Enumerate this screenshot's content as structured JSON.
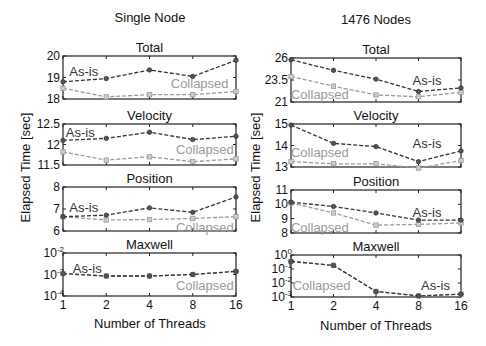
{
  "figure": {
    "left_title": "Single Node",
    "right_title": "1476 Nodes",
    "ylabel": "Elapsed Time [sec]",
    "xlabel": "Number of Threads",
    "colors": {
      "as_is": "#333333",
      "collapsed": "#9a9a9a",
      "frame": "#222222"
    }
  },
  "chart_data": [
    {
      "type": "line",
      "column": "Single Node",
      "title": "Total",
      "x": [
        1,
        2,
        4,
        8,
        16
      ],
      "xscale": "log2",
      "ylim": [
        18,
        20
      ],
      "yticks": [
        "18",
        "19",
        "20"
      ],
      "yscale": "linear",
      "series": [
        {
          "name": "As-is",
          "values": [
            18.8,
            18.95,
            19.35,
            19.05,
            19.8
          ]
        },
        {
          "name": "Collapsed",
          "values": [
            18.5,
            18.1,
            18.2,
            18.2,
            18.35
          ]
        }
      ],
      "labels": [
        {
          "text": "As-is",
          "pos": [
            0.12,
            0.35
          ]
        },
        {
          "text": "Collapsed",
          "pos": [
            0.79,
            0.63
          ]
        }
      ]
    },
    {
      "type": "line",
      "column": "Single Node",
      "title": "Velocity",
      "x": [
        1,
        2,
        4,
        8,
        16
      ],
      "xscale": "log2",
      "ylim": [
        11.5,
        12.5
      ],
      "yticks": [
        "11.5",
        "12",
        "12.5"
      ],
      "yscale": "linear",
      "series": [
        {
          "name": "As-is",
          "values": [
            12.1,
            12.15,
            12.3,
            12.12,
            12.2
          ]
        },
        {
          "name": "Collapsed",
          "values": [
            11.82,
            11.62,
            11.7,
            11.58,
            11.65
          ]
        }
      ],
      "labels": [
        {
          "text": "As-is",
          "pos": [
            0.1,
            0.2
          ]
        },
        {
          "text": "Collapsed",
          "pos": [
            0.82,
            0.6
          ]
        }
      ]
    },
    {
      "type": "line",
      "column": "Single Node",
      "title": "Position",
      "x": [
        1,
        2,
        4,
        8,
        16
      ],
      "xscale": "log2",
      "ylim": [
        6,
        8
      ],
      "yticks": [
        "6",
        "7",
        "8"
      ],
      "yscale": "linear",
      "series": [
        {
          "name": "As-is",
          "values": [
            6.65,
            6.72,
            7.05,
            6.85,
            7.55
          ]
        },
        {
          "name": "Collapsed",
          "values": [
            6.65,
            6.5,
            6.52,
            6.57,
            6.65
          ]
        }
      ],
      "labels": [
        {
          "text": "As-is",
          "pos": [
            0.12,
            0.45
          ]
        },
        {
          "text": "Collapsed",
          "pos": [
            0.82,
            0.92
          ]
        }
      ]
    },
    {
      "type": "line",
      "column": "Single Node",
      "title": "Maxwell",
      "x": [
        1,
        2,
        4,
        8,
        16
      ],
      "xscale": "log2",
      "ylim": [
        0.0001,
        0.01
      ],
      "yticks": [
        "10^-4",
        "10^-3",
        "10^-2"
      ],
      "yscale": "log",
      "series": [
        {
          "name": "As-is",
          "values": [
            0.0011,
            0.00085,
            0.00085,
            0.001,
            0.0014
          ]
        },
        {
          "name": "Collapsed",
          "values": [
            0.0011,
            0.00085,
            0.00085,
            0.001,
            0.0014
          ]
        }
      ],
      "labels": [
        {
          "text": "As-is",
          "pos": [
            0.14,
            0.35
          ]
        },
        {
          "text": "Collapsed",
          "pos": [
            0.82,
            0.75
          ]
        }
      ]
    },
    {
      "type": "line",
      "column": "1476 Nodes",
      "title": "Total",
      "x": [
        1,
        2,
        4,
        8,
        16
      ],
      "xscale": "log2",
      "ylim": [
        21,
        26
      ],
      "yticks": [
        "21",
        "23.5",
        "26"
      ],
      "yscale": "linear",
      "series": [
        {
          "name": "As-is",
          "values": [
            25.8,
            24.6,
            23.6,
            22.2,
            22.6
          ]
        },
        {
          "name": "Collapsed",
          "values": [
            23.9,
            22.8,
            21.8,
            21.6,
            22.1
          ]
        }
      ],
      "labels": [
        {
          "text": "As-is",
          "pos": [
            0.8,
            0.5
          ]
        },
        {
          "text": "Collapsed",
          "pos": [
            0.17,
            0.82
          ]
        }
      ]
    },
    {
      "type": "line",
      "column": "1476 Nodes",
      "title": "Velocity",
      "x": [
        1,
        2,
        4,
        8,
        16
      ],
      "xscale": "log2",
      "ylim": [
        13,
        15
      ],
      "yticks": [
        "13",
        "14",
        "15"
      ],
      "yscale": "linear",
      "series": [
        {
          "name": "As-is",
          "values": [
            14.95,
            14.1,
            13.95,
            13.25,
            13.75
          ]
        },
        {
          "name": "Collapsed",
          "values": [
            13.25,
            13.15,
            13.15,
            12.95,
            13.3
          ]
        }
      ],
      "labels": [
        {
          "text": "As-is",
          "pos": [
            0.8,
            0.45
          ]
        },
        {
          "text": "Collapsed",
          "pos": [
            0.17,
            0.65
          ]
        }
      ]
    },
    {
      "type": "line",
      "column": "1476 Nodes",
      "title": "Position",
      "x": [
        1,
        2,
        4,
        8,
        16
      ],
      "xscale": "log2",
      "ylim": [
        8,
        11
      ],
      "yticks": [
        "8",
        "9",
        "10",
        "11"
      ],
      "yscale": "linear",
      "series": [
        {
          "name": "As-is",
          "values": [
            10.15,
            9.85,
            9.4,
            8.9,
            8.9
          ]
        },
        {
          "name": "Collapsed",
          "values": [
            10.1,
            9.4,
            8.55,
            8.6,
            8.7
          ]
        }
      ],
      "labels": [
        {
          "text": "As-is",
          "pos": [
            0.8,
            0.5
          ]
        },
        {
          "text": "Collapsed",
          "pos": [
            0.17,
            0.85
          ]
        }
      ]
    },
    {
      "type": "line",
      "column": "1476 Nodes",
      "title": "Maxwell",
      "x": [
        1,
        2,
        4,
        8,
        16
      ],
      "xscale": "log2",
      "ylim": [
        0.001,
        1
      ],
      "yticks": [
        "10^-3",
        "10^-2",
        "10^-1",
        "10^0"
      ],
      "yscale": "log",
      "series": [
        {
          "name": "As-is",
          "values": [
            0.35,
            0.18,
            0.0025,
            0.0012,
            0.0016
          ]
        },
        {
          "name": "Collapsed",
          "values": [
            0.35,
            0.18,
            0.0025,
            0.0012,
            0.0016
          ]
        }
      ],
      "labels": [
        {
          "text": "As-is",
          "pos": [
            0.85,
            0.72
          ]
        },
        {
          "text": "Collapsed",
          "pos": [
            0.18,
            0.72
          ]
        }
      ]
    }
  ]
}
